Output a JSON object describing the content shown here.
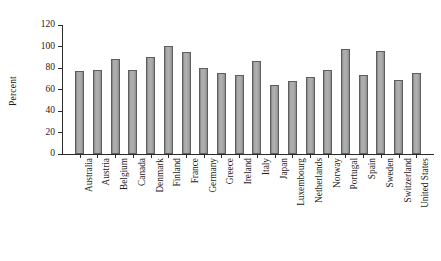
{
  "chart_data": {
    "type": "bar",
    "title": "",
    "xlabel": "",
    "ylabel": "Percent",
    "ylim": [
      0,
      120
    ],
    "yticks": [
      0,
      20,
      40,
      60,
      80,
      100,
      120
    ],
    "grid": false,
    "legend": null,
    "categories": [
      "Australia",
      "Austria",
      "Belgium",
      "Canada",
      "Denmark",
      "Finland",
      "France",
      "Germany",
      "Greece",
      "Ireland",
      "Italy",
      "Japan",
      "Luxembourg",
      "Netherlands",
      "Norway",
      "Portugal",
      "Spain",
      "Sweden",
      "Switzerland",
      "United States"
    ],
    "values": [
      77,
      78,
      88,
      78,
      90,
      100,
      94,
      80,
      75,
      73,
      86,
      64,
      67,
      71,
      78,
      97,
      73,
      95,
      68,
      75
    ],
    "bar_color": "#a9a9a9",
    "bar_edge_color": "#5e5e5e",
    "axis_color": "#2b2b2b"
  }
}
